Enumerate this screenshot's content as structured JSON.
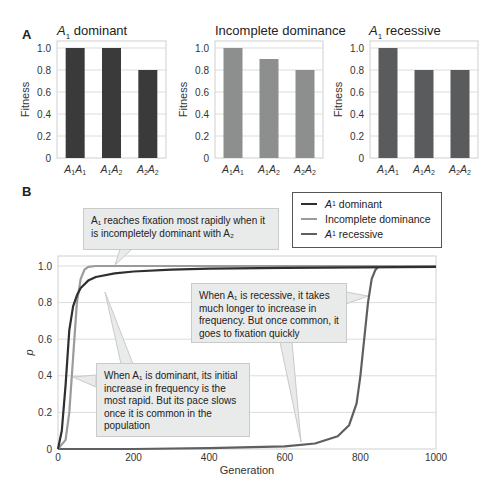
{
  "panel_a": {
    "letter": "A",
    "charts": [
      {
        "title_italic": "A",
        "title_sub": "1",
        "title_rest": " dominant",
        "color": "#3a3a3a"
      },
      {
        "title_italic": "",
        "title_sub": "",
        "title_rest": "Incomplete dominance",
        "color": "#8d8e8e"
      },
      {
        "title_italic": "A",
        "title_sub": "1",
        "title_rest": " recessive",
        "color": "#5a5b5c"
      }
    ]
  },
  "panel_b": {
    "letter": "B",
    "legend": [
      {
        "label_italic": "A",
        "label_sub": "1",
        "label_rest": " dominant",
        "color": "#2f2f2f"
      },
      {
        "label_italic": "",
        "label_sub": "",
        "label_rest": "Incomplete dominance",
        "color": "#9a9b9b"
      },
      {
        "label_italic": "A",
        "label_sub": "1",
        "label_rest": " recessive",
        "color": "#5e5f60"
      }
    ],
    "callouts": {
      "incomplete": "A₁ reaches fixation most rapidly when it is incompletely dominant with A₂",
      "recessive": "When A₁ is recessive, it takes much longer to increase in frequency. But once common, it goes to fixation quickly",
      "dominant": "When A₁ is dominant, its initial increase in frequency is the most rapid. But its pace slows once it is common in the population"
    }
  },
  "chart_data": [
    {
      "type": "bar",
      "title": "A1 dominant",
      "categories": [
        "A1A1",
        "A1A2",
        "A2A2"
      ],
      "values": [
        1.0,
        1.0,
        0.8
      ],
      "xlabel": "",
      "ylabel": "Fitness",
      "ylim": [
        0,
        1.0
      ],
      "yticks": [
        0,
        0.2,
        0.4,
        0.6,
        0.8,
        1.0
      ],
      "grid": true
    },
    {
      "type": "bar",
      "title": "Incomplete dominance",
      "categories": [
        "A1A1",
        "A1A2",
        "A2A2"
      ],
      "values": [
        1.0,
        0.9,
        0.8
      ],
      "xlabel": "",
      "ylabel": "Fitness",
      "ylim": [
        0,
        1.0
      ],
      "yticks": [
        0,
        0.2,
        0.4,
        0.6,
        0.8,
        1.0
      ],
      "grid": true
    },
    {
      "type": "bar",
      "title": "A1 recessive",
      "categories": [
        "A1A1",
        "A1A2",
        "A2A2"
      ],
      "values": [
        1.0,
        0.8,
        0.8
      ],
      "xlabel": "",
      "ylabel": "Fitness",
      "ylim": [
        0,
        1.0
      ],
      "yticks": [
        0,
        0.2,
        0.4,
        0.6,
        0.8,
        1.0
      ],
      "grid": true
    },
    {
      "type": "line",
      "title": "",
      "xlabel": "Generation",
      "ylabel": "p",
      "xlim": [
        0,
        1000
      ],
      "ylim": [
        0,
        1.0
      ],
      "xticks": [
        0,
        200,
        400,
        600,
        800,
        1000
      ],
      "yticks": [
        0,
        0.2,
        0.4,
        0.6,
        0.8,
        1.0
      ],
      "grid": true,
      "legend_position": "top-right",
      "series": [
        {
          "name": "A1 dominant",
          "x": [
            0,
            10,
            20,
            30,
            40,
            50,
            60,
            80,
            100,
            150,
            200,
            300,
            400,
            600,
            800,
            1000
          ],
          "y": [
            0,
            0.1,
            0.35,
            0.65,
            0.78,
            0.84,
            0.88,
            0.92,
            0.94,
            0.96,
            0.97,
            0.98,
            0.985,
            0.99,
            0.993,
            0.995
          ]
        },
        {
          "name": "Incomplete dominance",
          "x": [
            0,
            20,
            30,
            40,
            50,
            60,
            70,
            80,
            100,
            1000
          ],
          "y": [
            0,
            0.05,
            0.2,
            0.5,
            0.8,
            0.93,
            0.98,
            0.995,
            1.0,
            1.0
          ]
        },
        {
          "name": "A1 recessive",
          "x": [
            0,
            200,
            400,
            600,
            680,
            740,
            770,
            790,
            800,
            810,
            820,
            830,
            840,
            850,
            1000
          ],
          "y": [
            0,
            0.0,
            0.005,
            0.015,
            0.03,
            0.07,
            0.13,
            0.25,
            0.4,
            0.6,
            0.8,
            0.93,
            0.98,
            1.0,
            1.0
          ]
        }
      ]
    }
  ]
}
